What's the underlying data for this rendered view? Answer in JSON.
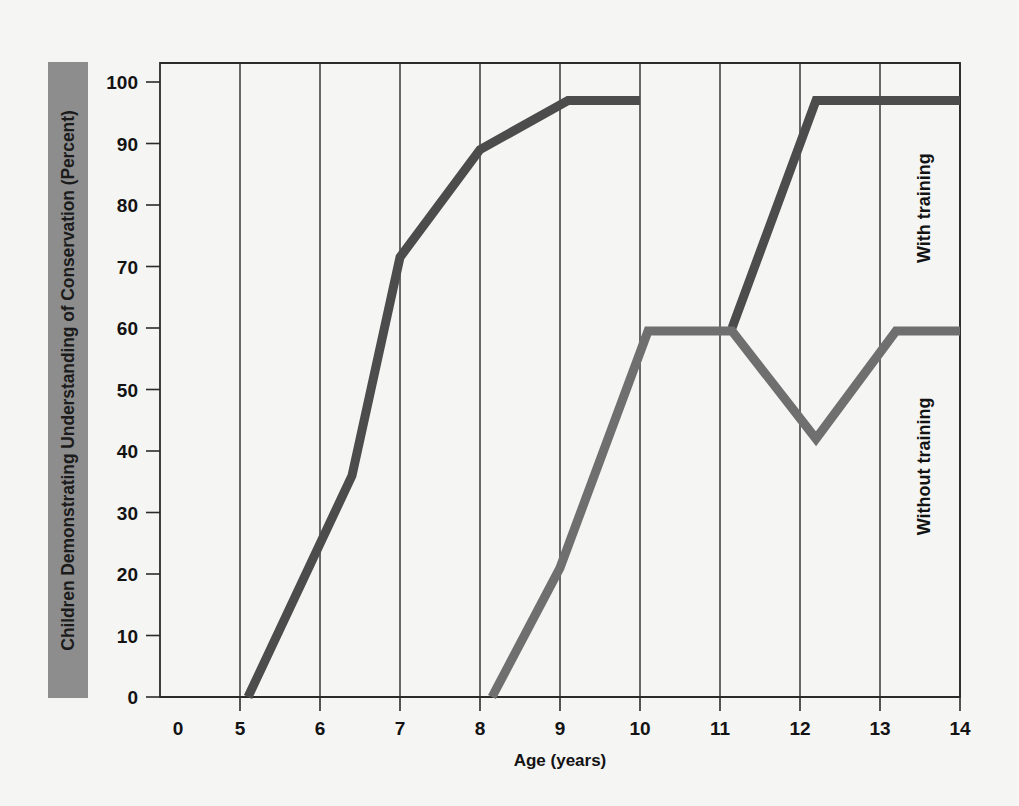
{
  "chart_data": {
    "type": "line",
    "title": "",
    "xlabel": "Age (years)",
    "ylabel": "Children Demonstrating Understanding of Conservation (Percent)",
    "xlim": [
      4.0,
      14.0
    ],
    "ylim": [
      0,
      100
    ],
    "xticks": [
      "0",
      "5",
      "6",
      "7",
      "8",
      "9",
      "10",
      "11",
      "12",
      "13",
      "14"
    ],
    "yticks": [
      "0",
      "10",
      "20",
      "30",
      "40",
      "50",
      "60",
      "70",
      "80",
      "90",
      "100"
    ],
    "grid": "vertical-only",
    "legend_position": "inline-right-rotated",
    "series": [
      {
        "name": "With training",
        "color": "#4c4c4c",
        "points": [
          {
            "x": 5.1,
            "y": 0
          },
          {
            "x": 6.4,
            "y": 36
          },
          {
            "x": 7.0,
            "y": 71.5
          },
          {
            "x": 8.0,
            "y": 89
          },
          {
            "x": 9.1,
            "y": 97
          },
          {
            "x": 10.0,
            "y": 97
          }
        ],
        "points_segment2": [
          {
            "x": 11.15,
            "y": 60
          },
          {
            "x": 12.2,
            "y": 97
          },
          {
            "x": 14.0,
            "y": 97
          }
        ]
      },
      {
        "name": "Without training",
        "color": "#6f6f6f",
        "points": [
          {
            "x": 8.15,
            "y": 0
          },
          {
            "x": 9.0,
            "y": 21
          },
          {
            "x": 10.1,
            "y": 59.5
          },
          {
            "x": 11.15,
            "y": 59.5
          },
          {
            "x": 12.2,
            "y": 42
          },
          {
            "x": 13.2,
            "y": 59.5
          },
          {
            "x": 14.0,
            "y": 59.5
          }
        ]
      }
    ],
    "annotations": [
      {
        "text": "With training",
        "x": 14.0,
        "y_range": [
          62,
          97
        ],
        "rotation": -90
      },
      {
        "text": "Without training",
        "x": 14.0,
        "y_range": [
          18,
          57
        ],
        "rotation": -90
      }
    ]
  },
  "colors": {
    "background": "#f5f5f3",
    "axis": "#2b2b2b",
    "ylabel_band": "#8d8d8d",
    "with_training": "#4c4c4c",
    "without_training": "#6f6f6f"
  }
}
